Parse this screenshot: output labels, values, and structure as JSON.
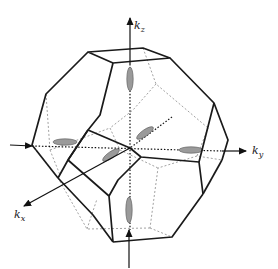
{
  "diagram": {
    "axes": [
      {
        "id": "kz",
        "label": "k",
        "subscript": "z",
        "direction": "up"
      },
      {
        "id": "ky",
        "label": "k",
        "subscript": "y",
        "direction": "right"
      },
      {
        "id": "kx",
        "label": "k",
        "subscript": "x",
        "direction": "lower-left"
      }
    ],
    "ellipsoid_count": 6,
    "colors": {
      "edge": "#1a1a1a",
      "hidden_edge": "#8a8a8a",
      "ellipsoid_fill": "#9a9a9a",
      "background": "#ffffff"
    }
  }
}
